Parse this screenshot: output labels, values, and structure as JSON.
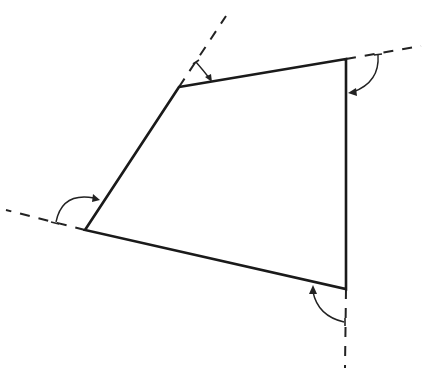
{
  "diagram": {
    "colors": {
      "background": "#ffffff",
      "stroke": "#1a1a1a"
    },
    "polygon": {
      "type": "quadrilateral",
      "vertices": [
        {
          "name": "top-left",
          "x": 179,
          "y": 87
        },
        {
          "name": "top-right",
          "x": 346,
          "y": 59
        },
        {
          "name": "bottom-right",
          "x": 346,
          "y": 289
        },
        {
          "name": "bottom-left",
          "x": 85,
          "y": 230
        }
      ]
    },
    "extensions": [
      {
        "name": "extension-top",
        "from": [
          179,
          87
        ],
        "to": [
          226,
          16
        ]
      },
      {
        "name": "extension-right",
        "from": [
          346,
          59
        ],
        "to": [
          421,
          46
        ]
      },
      {
        "name": "extension-left",
        "from": [
          85,
          230
        ],
        "to": [
          6,
          210
        ]
      },
      {
        "name": "extension-bottom",
        "from": [
          346,
          289
        ],
        "to": [
          345,
          368
        ]
      }
    ],
    "angle_markers": [
      {
        "name": "exterior-angle-top-left",
        "vertex": "top-left"
      },
      {
        "name": "exterior-angle-top-right",
        "vertex": "top-right"
      },
      {
        "name": "exterior-angle-bottom-right",
        "vertex": "bottom-right"
      },
      {
        "name": "exterior-angle-bottom-left",
        "vertex": "bottom-left"
      }
    ]
  }
}
